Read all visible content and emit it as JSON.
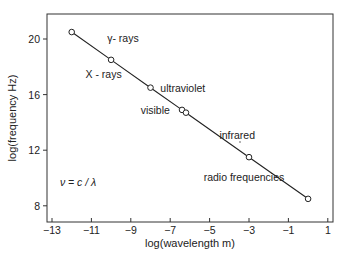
{
  "chart_data": {
    "type": "line",
    "title": "",
    "xlabel": "log(wavelength m)",
    "ylabel": "log(frequency Hz)",
    "xlim": [
      -13.5,
      1.2
    ],
    "ylim": [
      6.9,
      21.8
    ],
    "xticks": [
      -13,
      -11,
      -9,
      -7,
      -5,
      -3,
      -1,
      1
    ],
    "xtick_labels": [
      "−13",
      "−11",
      "−9",
      "−7",
      "−5",
      "−3",
      "−1",
      "1"
    ],
    "yticks": [
      8,
      12,
      16,
      20
    ],
    "ytick_labels": [
      "8",
      "12",
      "16",
      "20"
    ],
    "grid": false,
    "legend": null,
    "series": [
      {
        "name": "electromagnetic spectrum",
        "marker": "open-circle",
        "x": [
          -12,
          -10,
          -8,
          -6.4,
          -6.2,
          -3,
          0
        ],
        "y": [
          20.5,
          18.5,
          16.5,
          14.9,
          14.7,
          11.5,
          8.5
        ]
      }
    ],
    "annotations": [
      {
        "text": "γ- rays",
        "x": -10.2,
        "y": 19.8
      },
      {
        "text": "X - rays",
        "x": -11.3,
        "y": 17.2
      },
      {
        "text": "ultraviolet",
        "x": -7.5,
        "y": 16.2
      },
      {
        "text": "visible",
        "x": -8.5,
        "y": 14.6
      },
      {
        "text": "infrared",
        "x": -4.5,
        "y": 12.8
      },
      {
        "text": "radio frequencies",
        "x": -5.3,
        "y": 9.8
      },
      {
        "text": "ν = c / λ",
        "x": -12.6,
        "y": 9.4,
        "italic": true
      }
    ]
  }
}
